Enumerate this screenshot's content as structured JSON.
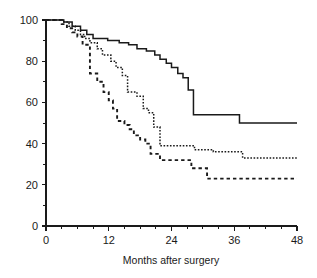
{
  "figure": {
    "title": "",
    "background_color": "#ffffff",
    "ink_color": "#1a1a1a",
    "width": 317,
    "height": 278
  },
  "axes": {
    "x": {
      "label": "Months after surgery",
      "major_ticks": [
        0,
        12,
        24,
        36,
        48
      ],
      "major_tick_labels": [
        "0",
        "12",
        "24",
        "36",
        "48"
      ],
      "minor_tick_step": 3,
      "range": [
        0,
        48
      ]
    },
    "y": {
      "label": "",
      "major_ticks": [
        0,
        20,
        40,
        60,
        80,
        100
      ],
      "major_tick_labels": [
        "0",
        "20",
        "40",
        "60",
        "80",
        "100"
      ],
      "minor_tick_step": 10,
      "range": [
        0,
        100
      ]
    }
  },
  "chart_data": {
    "type": "line",
    "subtype": "kaplan-meier-survival-step",
    "title": "",
    "xlabel": "Months after surgery",
    "ylabel": "",
    "xlim": [
      0,
      48
    ],
    "ylim": [
      0,
      100
    ],
    "grid": false,
    "legend": "none",
    "x_tick_labels": [
      "0",
      "12",
      "24",
      "36",
      "48"
    ],
    "y_tick_labels": [
      "0",
      "20",
      "40",
      "60",
      "80",
      "100"
    ],
    "series": [
      {
        "name": "Group 1 (solid)",
        "linestyle": "solid",
        "color": "#1a1a1a",
        "points": [
          [
            0,
            100
          ],
          [
            3.0,
            100
          ],
          [
            3.4,
            99
          ],
          [
            4.6,
            99
          ],
          [
            5.0,
            97
          ],
          [
            6.2,
            97
          ],
          [
            6.6,
            95
          ],
          [
            7.4,
            95
          ],
          [
            7.8,
            93
          ],
          [
            8.6,
            93
          ],
          [
            9.0,
            91
          ],
          [
            11.4,
            91
          ],
          [
            11.8,
            90
          ],
          [
            13.6,
            90
          ],
          [
            14.0,
            89
          ],
          [
            15.4,
            89
          ],
          [
            15.8,
            88
          ],
          [
            17.0,
            88
          ],
          [
            17.4,
            86
          ],
          [
            18.8,
            86
          ],
          [
            19.2,
            85
          ],
          [
            20.4,
            85
          ],
          [
            20.8,
            83
          ],
          [
            21.4,
            83
          ],
          [
            21.8,
            81
          ],
          [
            22.6,
            81
          ],
          [
            23.0,
            79
          ],
          [
            23.6,
            79
          ],
          [
            24.0,
            77
          ],
          [
            24.8,
            77
          ],
          [
            25.2,
            74
          ],
          [
            25.8,
            74
          ],
          [
            26.2,
            72
          ],
          [
            26.8,
            72
          ],
          [
            27.2,
            66
          ],
          [
            27.8,
            66
          ],
          [
            28.2,
            54
          ],
          [
            36.6,
            54
          ],
          [
            37.0,
            50
          ],
          [
            48,
            50
          ]
        ]
      },
      {
        "name": "Group 2 (dotted)",
        "linestyle": "dotted",
        "color": "#1a1a1a",
        "points": [
          [
            0,
            100
          ],
          [
            2.8,
            100
          ],
          [
            3.2,
            99
          ],
          [
            4.0,
            99
          ],
          [
            4.4,
            97
          ],
          [
            5.2,
            97
          ],
          [
            5.6,
            95
          ],
          [
            6.2,
            95
          ],
          [
            6.6,
            93
          ],
          [
            7.0,
            93
          ],
          [
            7.4,
            91
          ],
          [
            8.0,
            91
          ],
          [
            8.4,
            89
          ],
          [
            9.4,
            89
          ],
          [
            9.8,
            86
          ],
          [
            10.4,
            86
          ],
          [
            10.8,
            83
          ],
          [
            12.0,
            83
          ],
          [
            12.4,
            80
          ],
          [
            13.0,
            80
          ],
          [
            13.4,
            77
          ],
          [
            14.2,
            77
          ],
          [
            14.6,
            73
          ],
          [
            15.2,
            73
          ],
          [
            15.6,
            65
          ],
          [
            17.0,
            65
          ],
          [
            17.4,
            63
          ],
          [
            18.2,
            63
          ],
          [
            18.6,
            57
          ],
          [
            19.2,
            57
          ],
          [
            19.6,
            55
          ],
          [
            20.2,
            55
          ],
          [
            20.6,
            48
          ],
          [
            21.4,
            48
          ],
          [
            21.8,
            39
          ],
          [
            28.0,
            39
          ],
          [
            28.4,
            37
          ],
          [
            31.6,
            37
          ],
          [
            32.0,
            36
          ],
          [
            37.2,
            36
          ],
          [
            37.6,
            33
          ],
          [
            48,
            33
          ]
        ]
      },
      {
        "name": "Group 3 (dashed)",
        "linestyle": "dashed",
        "color": "#1a1a1a",
        "points": [
          [
            0,
            100
          ],
          [
            2.6,
            100
          ],
          [
            3.0,
            98
          ],
          [
            3.6,
            98
          ],
          [
            4.0,
            96
          ],
          [
            4.6,
            96
          ],
          [
            5.0,
            94
          ],
          [
            5.6,
            94
          ],
          [
            6.0,
            92
          ],
          [
            6.6,
            92
          ],
          [
            7.0,
            88
          ],
          [
            8.0,
            88
          ],
          [
            8.4,
            74
          ],
          [
            9.4,
            74
          ],
          [
            9.8,
            70
          ],
          [
            10.6,
            70
          ],
          [
            11.0,
            65
          ],
          [
            11.6,
            65
          ],
          [
            12.0,
            61
          ],
          [
            12.4,
            61
          ],
          [
            12.8,
            57
          ],
          [
            13.2,
            57
          ],
          [
            13.6,
            51
          ],
          [
            14.6,
            51
          ],
          [
            15.0,
            49
          ],
          [
            15.6,
            49
          ],
          [
            16.0,
            47
          ],
          [
            16.4,
            47
          ],
          [
            16.8,
            44
          ],
          [
            17.6,
            44
          ],
          [
            18.0,
            42
          ],
          [
            18.6,
            42
          ],
          [
            19.0,
            40
          ],
          [
            19.6,
            40
          ],
          [
            20.0,
            35
          ],
          [
            21.4,
            35
          ],
          [
            21.8,
            32
          ],
          [
            27.4,
            32
          ],
          [
            27.8,
            28
          ],
          [
            30.4,
            28
          ],
          [
            30.8,
            23
          ],
          [
            48,
            23
          ]
        ]
      }
    ]
  }
}
